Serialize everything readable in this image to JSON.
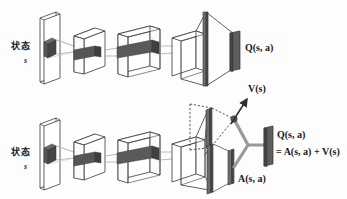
{
  "figure": {
    "colors": {
      "stroke": "#3a3a3a",
      "dark_bar": "#4d4d4d",
      "mid_gray": "#8a8a8a",
      "light_gray": "#c9c9c9",
      "face": "#ffffff",
      "background": "#fdfdfd"
    }
  },
  "rows": {
    "top": {
      "name": "standard-dqn-row",
      "input_label_cn": "状态",
      "input_label_var": "s",
      "output_label": "Q(s, a)"
    },
    "bottom": {
      "name": "dueling-dqn-row",
      "input_label_cn": "状态",
      "input_label_var": "s",
      "value_stream_label": "V(s)",
      "advantage_stream_label": "A(s, a)",
      "output_label_line1": "Q(s, a)",
      "output_label_line2": "= A(s, a) + V(s)"
    }
  },
  "icons": {
    "state_plane": "input-plane-icon",
    "conv_box": "conv-layer-box-icon",
    "fc_bar": "fully-connected-bar-icon",
    "output_bar": "output-bar-icon",
    "merge_node": "merge-node-icon",
    "up_arrow": "up-right-arrow-icon"
  }
}
